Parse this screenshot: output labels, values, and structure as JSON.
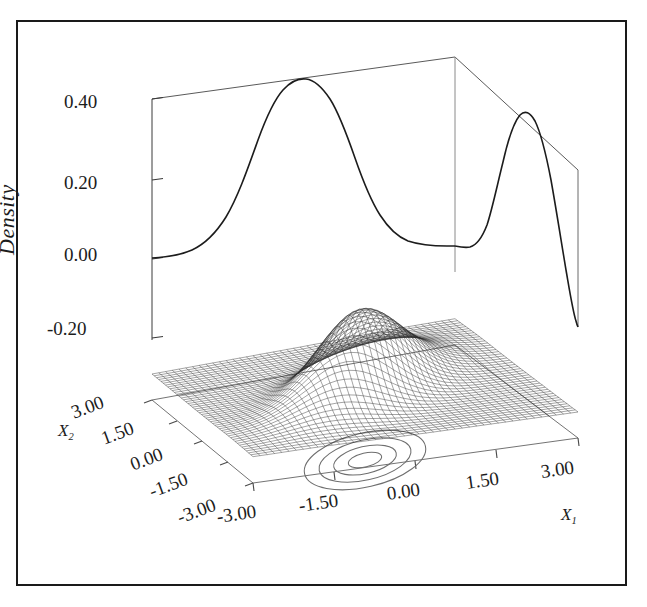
{
  "figure": {
    "kind": "3d-perspective-wireframe-density-plot",
    "background_color": "#ffffff",
    "line_color": "#1c1c1c",
    "frame_color": "#1a1a1a",
    "axis_color": "#555555"
  },
  "axes": {
    "z": {
      "title": "Density",
      "ticks": [
        "0.40",
        "0.20",
        "0.00",
        "-0.20"
      ],
      "values": [
        0.4,
        0.2,
        0.0,
        -0.2
      ]
    },
    "x1": {
      "title": "X",
      "subscript": "1",
      "ticks": [
        "-3.00",
        "-1.50",
        "0.00",
        "1.50",
        "3.00"
      ],
      "values": [
        -3.0,
        -1.5,
        0.0,
        1.5,
        3.0
      ]
    },
    "x2": {
      "title": "X",
      "subscript": "2",
      "ticks": [
        "3.00",
        "1.50",
        "0.00",
        "-1.50",
        "-3.00"
      ],
      "values": [
        3.0,
        1.5,
        0.0,
        -1.5,
        -3.0
      ]
    }
  },
  "chart_data": {
    "type": "surface",
    "title": "",
    "xlabel": "X1",
    "ylabel": "X2",
    "zlabel": "Density",
    "xlim": [
      -3.0,
      3.0
    ],
    "ylim": [
      -3.0,
      3.0
    ],
    "zlim": [
      -0.2,
      0.4
    ],
    "grid": false,
    "legend": "none",
    "surface": {
      "description": "Bivariate normal density mesh with correlated elongated single mode",
      "mesh_nx": 45,
      "mesh_ny": 45,
      "peak_density": 0.2,
      "mean": [
        0.0,
        0.0
      ],
      "sigma_x1": 1.0,
      "sigma_x2": 1.0,
      "correlation": 0.6,
      "wireframe": true,
      "fill": "#ffffff",
      "stroke": "#2a2a2a"
    },
    "marginals": [
      {
        "name": "marginal-x1-back-wall",
        "wall": "back-left",
        "peak_value": 0.4,
        "mean": 0.0,
        "sigma": 1.0
      },
      {
        "name": "marginal-x2-right-wall",
        "wall": "back-right",
        "peak_value": 0.37,
        "mean": 0.0,
        "sigma": 0.72
      }
    ],
    "contours": {
      "name": "floor-contours",
      "count": 4,
      "levels": [
        0.04,
        0.08,
        0.12,
        0.16
      ],
      "shape": "ellipse",
      "tilt_deg": -28,
      "stroke": "#555555"
    }
  },
  "tick_positions": {
    "z": [
      {
        "label": "0.40",
        "left": 64,
        "top": 91
      },
      {
        "label": "0.20",
        "left": 64,
        "top": 172
      },
      {
        "label": "0.00",
        "left": 64,
        "top": 244
      },
      {
        "label": "-0.20",
        "left": 47,
        "top": 318
      }
    ],
    "x2": [
      {
        "label": "3.00",
        "left": 70,
        "top": 408,
        "rot": -18
      },
      {
        "label": "1.50",
        "left": 100,
        "top": 434,
        "rot": -18
      },
      {
        "label": "0.00",
        "left": 130,
        "top": 460,
        "rot": -18
      },
      {
        "label": "-1.50",
        "left": 152,
        "top": 487,
        "rot": -18
      },
      {
        "label": "-3.00",
        "left": 186,
        "top": 513,
        "rot": -18
      }
    ],
    "x1": [
      {
        "label": "-3.00",
        "left": 220,
        "top": 511,
        "rot": 18
      },
      {
        "label": "-1.50",
        "left": 300,
        "top": 500,
        "rot": 18
      },
      {
        "label": "0.00",
        "left": 390,
        "top": 490,
        "rot": 18
      },
      {
        "label": "1.50",
        "left": 460,
        "top": 478,
        "rot": 18
      },
      {
        "label": "3.00",
        "left": 533,
        "top": 466,
        "rot": 18
      }
    ]
  }
}
